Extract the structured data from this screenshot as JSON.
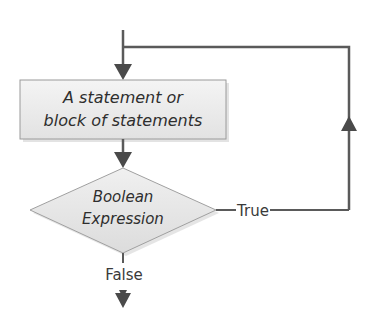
{
  "diagram": {
    "type": "flowchart",
    "nodes": {
      "statement": {
        "shape": "rectangle",
        "line1": "A statement or",
        "line2": "block of statements"
      },
      "condition": {
        "shape": "diamond",
        "line1": "Boolean",
        "line2": "Expression"
      }
    },
    "edges": {
      "true_label": "True",
      "false_label": "False"
    },
    "colors": {
      "line": "#5a5a5a",
      "arrow": "#4a4a4a",
      "box_fill": "#ececec",
      "box_border": "#9a9a9a",
      "diamond_fill": "#e6e6e6",
      "diamond_border": "#a0a0a0",
      "text": "#2e2e2e"
    }
  }
}
